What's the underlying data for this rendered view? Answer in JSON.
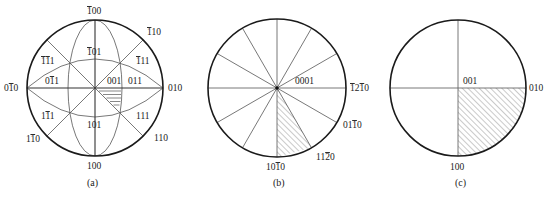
{
  "figure": {
    "panels": [
      {
        "id": "a",
        "caption": "(a)",
        "description": "Cubic [001] standard stereographic projection",
        "labels": {
          "top": "100",
          "top_bar": "-100",
          "top_right": "-110",
          "upper_left_111": "-1-11",
          "upper_right_111": "-111",
          "upper_101": "-101",
          "left_011": "0-11",
          "center": "001",
          "right_011": "011",
          "left_010": "0-10",
          "right_010": "010",
          "lower_left_111": "1-11",
          "lower_right_111": "111",
          "lower_101": "101",
          "lower_left_110": "1-10",
          "lower_right_110": "110",
          "bottom": "100"
        },
        "hatched_region": "unit triangle 001-011-111"
      },
      {
        "id": "b",
        "caption": "(b)",
        "description": "Hexagonal [0001] stereographic projection",
        "labels": {
          "center": "0001",
          "right": "-12-10",
          "lower_right": "01-10",
          "lower_right2": "11-20",
          "bottom": "10-10"
        },
        "radial_lines": 12,
        "hatched_region": "wedge 10-10 to 11-20"
      },
      {
        "id": "c",
        "caption": "(c)",
        "description": "Orthorhombic [001] stereographic projection",
        "labels": {
          "center": "001",
          "right": "010",
          "bottom": "100"
        },
        "hatched_region": "quadrant 001-010-100"
      }
    ]
  }
}
